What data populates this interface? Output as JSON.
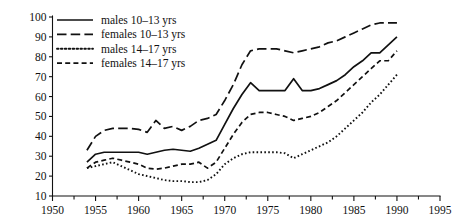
{
  "chart_data": {
    "type": "line",
    "title": "",
    "subtitle": "",
    "xlabel": "",
    "ylabel": "",
    "xlim": [
      1950,
      1995
    ],
    "ylim": [
      10,
      100
    ],
    "x_major_ticks": [
      1950,
      1955,
      1960,
      1965,
      1970,
      1975,
      1980,
      1985,
      1990,
      1995
    ],
    "x_minor_ticks": [
      1952.5,
      1957.5,
      1962.5,
      1967.5,
      1972.5,
      1977.5,
      1982.5,
      1987.5,
      1992.5
    ],
    "x_tick_labels": [
      "1950",
      "1955",
      "1960",
      "1965",
      "1970",
      "1975",
      "1980",
      "1985",
      "1990",
      "1995"
    ],
    "y_ticks": [
      10,
      20,
      30,
      40,
      50,
      60,
      70,
      80,
      90,
      100
    ],
    "y_tick_labels": [
      "10",
      "20",
      "30",
      "40",
      "50",
      "60",
      "70",
      "80",
      "90",
      "100"
    ],
    "grid": false,
    "legend_position": "top-left",
    "series": [
      {
        "name": "males 10-13 yrs",
        "label": "males 10–13 yrs",
        "style": "solid",
        "color": "#111111",
        "x": [
          1954,
          1955,
          1956,
          1957,
          1958,
          1959,
          1960,
          1961,
          1962,
          1963,
          1964,
          1965,
          1966,
          1967,
          1968,
          1969,
          1970,
          1971,
          1972,
          1973,
          1974,
          1975,
          1976,
          1977,
          1978,
          1979,
          1980,
          1981,
          1982,
          1983,
          1984,
          1985,
          1986,
          1987,
          1988,
          1989,
          1990
        ],
        "y": [
          27,
          31,
          32,
          32,
          32,
          32,
          32,
          31,
          32,
          33,
          33.5,
          33,
          32.5,
          34,
          36,
          38,
          46,
          54,
          61,
          67,
          63,
          63,
          63,
          63,
          69,
          63,
          63,
          64,
          66,
          68,
          71,
          75,
          78,
          82,
          82,
          86,
          90
        ]
      },
      {
        "name": "females 10-13 yrs",
        "label": "females 10–13 yrs",
        "style": "long-dash",
        "color": "#111111",
        "x": [
          1954,
          1955,
          1956,
          1957,
          1958,
          1959,
          1960,
          1961,
          1962,
          1963,
          1964,
          1965,
          1966,
          1967,
          1968,
          1969,
          1970,
          1971,
          1972,
          1973,
          1974,
          1975,
          1976,
          1977,
          1978,
          1979,
          1980,
          1981,
          1982,
          1983,
          1984,
          1985,
          1986,
          1987,
          1988,
          1989,
          1990
        ],
        "y": [
          33,
          40,
          43,
          44,
          44,
          44,
          43.5,
          42,
          48,
          44,
          45,
          43,
          45,
          48,
          49,
          51,
          58,
          66,
          76,
          83,
          84,
          84,
          84,
          83,
          82,
          83,
          84,
          85,
          87,
          88,
          90,
          92,
          94,
          96,
          97,
          97,
          97
        ]
      },
      {
        "name": "males 14-17 yrs",
        "label": "males 14–17 yrs",
        "style": "dotted",
        "color": "#111111",
        "x": [
          1954,
          1955,
          1956,
          1957,
          1958,
          1959,
          1960,
          1961,
          1962,
          1963,
          1964,
          1965,
          1966,
          1967,
          1968,
          1969,
          1970,
          1971,
          1972,
          1973,
          1974,
          1975,
          1976,
          1977,
          1978,
          1979,
          1980,
          1981,
          1982,
          1983,
          1984,
          1985,
          1986,
          1987,
          1988,
          1989,
          1990
        ],
        "y": [
          24,
          25,
          26,
          27,
          25,
          23,
          21,
          20,
          19,
          18,
          17.5,
          17.5,
          17,
          17,
          18,
          21,
          26,
          29,
          31,
          32,
          32,
          32,
          32,
          31.5,
          29,
          31,
          33,
          35,
          37,
          40,
          44,
          48,
          52,
          57,
          61,
          66,
          71
        ]
      },
      {
        "name": "females 14-17 yrs",
        "label": "females 14–17 yrs",
        "style": "short-dash",
        "color": "#111111",
        "x": [
          1954,
          1955,
          1956,
          1957,
          1958,
          1959,
          1960,
          1961,
          1962,
          1963,
          1964,
          1965,
          1966,
          1967,
          1968,
          1969,
          1970,
          1971,
          1972,
          1973,
          1974,
          1975,
          1976,
          1977,
          1978,
          1979,
          1980,
          1981,
          1982,
          1983,
          1984,
          1985,
          1986,
          1987,
          1988,
          1989,
          1990
        ],
        "y": [
          24,
          27,
          28,
          29,
          28,
          27,
          26,
          24,
          23.5,
          24,
          25,
          26,
          26,
          27,
          24,
          27,
          34,
          41,
          47,
          51,
          52,
          52,
          51,
          50,
          48,
          49,
          50,
          52,
          55,
          58,
          62,
          66,
          70,
          74,
          78,
          78,
          83
        ]
      }
    ]
  },
  "legend": {
    "entries": [
      {
        "label": "males 10–13 yrs",
        "style": "solid"
      },
      {
        "label": "females 10–13 yrs",
        "style": "long-dash"
      },
      {
        "label": "males 14–17 yrs",
        "style": "dotted"
      },
      {
        "label": "females 14–17 yrs",
        "style": "short-dash"
      }
    ]
  }
}
